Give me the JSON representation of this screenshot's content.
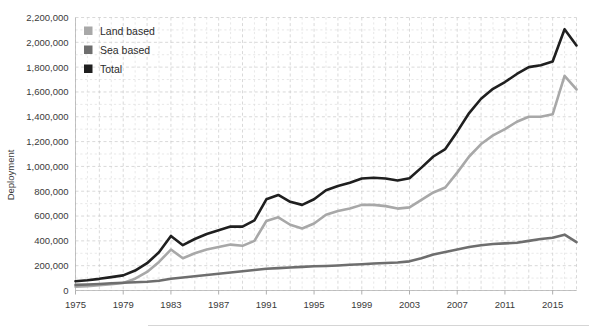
{
  "chart_data": {
    "type": "line",
    "title": "",
    "xlabel": "",
    "ylabel": "Deployment",
    "xlim": [
      1975,
      2017
    ],
    "ylim": [
      0,
      2200000
    ],
    "ytick_step": 200000,
    "grid": true,
    "legend_position": "top-left",
    "ytick_labels": [
      "0",
      "200,000",
      "400,000",
      "600,000",
      "800,000",
      "1,000,000",
      "1,200,000",
      "1,400,000",
      "1,600,000",
      "1,800,000",
      "2,000,000",
      "2,200,000"
    ],
    "ytick_values": [
      0,
      200000,
      400000,
      600000,
      800000,
      1000000,
      1200000,
      1400000,
      1600000,
      1800000,
      2000000,
      2200000
    ],
    "xtick_labels": [
      "1975",
      "1979",
      "1983",
      "1987",
      "1991",
      "1995",
      "1999",
      "2003",
      "2007",
      "2011",
      "2015"
    ],
    "xtick_values": [
      1975,
      1979,
      1983,
      1987,
      1991,
      1995,
      1999,
      2003,
      2007,
      2011,
      2015
    ],
    "x": [
      1975,
      1976,
      1977,
      1978,
      1979,
      1980,
      1981,
      1982,
      1983,
      1984,
      1985,
      1986,
      1987,
      1988,
      1989,
      1990,
      1991,
      1992,
      1993,
      1994,
      1995,
      1996,
      1997,
      1998,
      1999,
      2000,
      2001,
      2002,
      2003,
      2004,
      2005,
      2006,
      2007,
      2008,
      2009,
      2010,
      2011,
      2012,
      2013,
      2014,
      2015,
      2016,
      2017
    ],
    "series": [
      {
        "name": "Land based",
        "color": "#a8a8a8",
        "values": [
          30000,
          35000,
          42000,
          50000,
          60000,
          95000,
          150000,
          230000,
          330000,
          260000,
          300000,
          330000,
          350000,
          370000,
          360000,
          400000,
          560000,
          590000,
          530000,
          500000,
          540000,
          610000,
          640000,
          660000,
          690000,
          690000,
          680000,
          660000,
          670000,
          730000,
          790000,
          830000,
          950000,
          1080000,
          1180000,
          1250000,
          1300000,
          1360000,
          1400000,
          1400000,
          1420000,
          1730000,
          1620000
        ]
      },
      {
        "name": "Sea based",
        "color": "#6e6e6e",
        "values": [
          45000,
          48000,
          52000,
          58000,
          62000,
          66000,
          70000,
          78000,
          95000,
          105000,
          115000,
          125000,
          135000,
          145000,
          155000,
          165000,
          175000,
          180000,
          185000,
          190000,
          195000,
          198000,
          202000,
          208000,
          212000,
          218000,
          222000,
          226000,
          235000,
          260000,
          290000,
          310000,
          330000,
          350000,
          365000,
          375000,
          380000,
          385000,
          400000,
          415000,
          425000,
          450000,
          390000
        ]
      },
      {
        "name": "Total",
        "color": "#1f1f1f",
        "values": [
          75000,
          83000,
          94000,
          108000,
          122000,
          161000,
          220000,
          308000,
          440000,
          365000,
          415000,
          455000,
          485000,
          515000,
          515000,
          565000,
          735000,
          770000,
          715000,
          690000,
          735000,
          808000,
          842000,
          868000,
          902000,
          908000,
          902000,
          886000,
          905000,
          990000,
          1080000,
          1140000,
          1280000,
          1430000,
          1545000,
          1625000,
          1680000,
          1745000,
          1800000,
          1815000,
          1845000,
          2105000,
          1975000
        ]
      }
    ],
    "legend": [
      {
        "label": "Land based",
        "color": "#a8a8a8"
      },
      {
        "label": "Sea based",
        "color": "#6e6e6e"
      },
      {
        "label": "Total",
        "color": "#1f1f1f"
      }
    ]
  }
}
